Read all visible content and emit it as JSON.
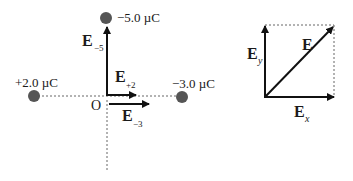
{
  "diagram": {
    "left_panel": {
      "charges": [
        {
          "id": "top",
          "label": "−5.0 µC",
          "color": "#555555"
        },
        {
          "id": "left",
          "label": "+2.0 µC",
          "color": "#555555"
        },
        {
          "id": "right",
          "label": "−3.0 µC",
          "color": "#555555"
        }
      ],
      "origin_label": "O",
      "vectors": [
        {
          "name": "E",
          "subscript": "−5"
        },
        {
          "name": "E",
          "subscript": "+2"
        },
        {
          "name": "E",
          "subscript": "−3"
        }
      ]
    },
    "right_panel": {
      "vectors": [
        {
          "name": "E",
          "subscript": ""
        },
        {
          "name": "E",
          "subscript": "y"
        },
        {
          "name": "E",
          "subscript": "x"
        }
      ]
    },
    "colors": {
      "line": "#111111",
      "dashed": "#666666",
      "charge": "#555555"
    }
  }
}
